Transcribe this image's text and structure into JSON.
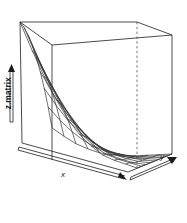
{
  "plot": {
    "type": "3d-perspective-wireframe-surface",
    "background_color": "#ffffff",
    "line_color": "#2b2b2b",
    "axis_labels": {
      "x": "x",
      "y": "y",
      "z": "z.matrix"
    },
    "box": {
      "visible": true,
      "style": "solid",
      "hidden_edge_style": "dashed"
    },
    "ticks": {
      "shown": false,
      "tick_labels_x": [],
      "tick_labels_y": [],
      "tick_labels_z": []
    },
    "arrows": {
      "x_arrow": "arrow-right-down",
      "y_arrow": "arrow-up-right",
      "z_arrow": "arrow-up"
    }
  },
  "chart_data": {
    "type": "surface",
    "title": "",
    "subtitle": "",
    "xlabel": "x",
    "ylabel": "y",
    "zlabel": "z.matrix",
    "grid": true,
    "legend": "none",
    "projection": "perspective",
    "surface_shape": "saddle/valley, rising toward the far-left and near-left edges, minimum along the central trough running front-right",
    "mesh_rows": 9,
    "mesh_cols": 11,
    "x": [
      0,
      0.1,
      0.2,
      0.3,
      0.4,
      0.5,
      0.6,
      0.7,
      0.8,
      0.9,
      1.0
    ],
    "y": [
      0,
      0.125,
      0.25,
      0.375,
      0.5,
      0.625,
      0.75,
      0.875,
      1.0
    ],
    "xlim": [
      0,
      1
    ],
    "ylim": [
      0,
      1
    ],
    "zlim": [
      0,
      1
    ],
    "z": [
      [
        1.0,
        0.77,
        0.57,
        0.4,
        0.26,
        0.16,
        0.09,
        0.04,
        0.02,
        0.01,
        0.0
      ],
      [
        0.98,
        0.75,
        0.55,
        0.38,
        0.25,
        0.15,
        0.08,
        0.04,
        0.02,
        0.01,
        0.0
      ],
      [
        0.94,
        0.71,
        0.52,
        0.36,
        0.23,
        0.14,
        0.08,
        0.03,
        0.01,
        0.0,
        0.0
      ],
      [
        0.88,
        0.66,
        0.48,
        0.33,
        0.21,
        0.12,
        0.06,
        0.03,
        0.01,
        0.0,
        0.0
      ],
      [
        0.8,
        0.6,
        0.43,
        0.29,
        0.18,
        0.1,
        0.05,
        0.02,
        0.01,
        0.0,
        0.0
      ],
      [
        0.7,
        0.52,
        0.37,
        0.25,
        0.15,
        0.08,
        0.04,
        0.01,
        0.0,
        0.0,
        0.0
      ],
      [
        0.58,
        0.43,
        0.3,
        0.2,
        0.12,
        0.06,
        0.03,
        0.01,
        0.0,
        0.0,
        0.0
      ],
      [
        0.44,
        0.32,
        0.22,
        0.14,
        0.08,
        0.04,
        0.02,
        0.0,
        0.0,
        0.0,
        0.0
      ],
      [
        0.28,
        0.2,
        0.13,
        0.08,
        0.04,
        0.02,
        0.01,
        0.0,
        0.0,
        0.0,
        0.0
      ]
    ]
  }
}
